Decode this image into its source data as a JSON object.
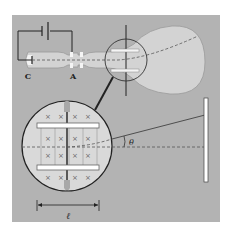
{
  "labels": {
    "cathode": "C",
    "anode": "A",
    "angle": "θ",
    "length": "ℓ",
    "field_marker": "×"
  },
  "colors": {
    "panel": "#b3b3b3",
    "tube": "#d3d3d3",
    "tube_edge": "#9a9a9a",
    "magnifier": "#d9d9d9",
    "plate": "#ffffff",
    "line": "#222222",
    "beam": "#555555"
  }
}
